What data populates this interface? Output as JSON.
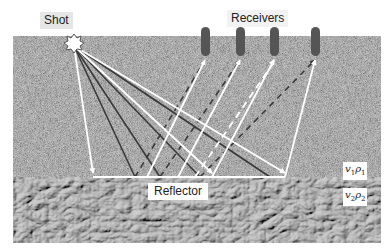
{
  "labels": {
    "shot": "Shot",
    "receivers": "Receivers",
    "reflector": "Reflector"
  },
  "layers": [
    {
      "name": "upper",
      "velocity": "v",
      "velocity_sub": "1",
      "density": "ρ",
      "density_sub": "1"
    },
    {
      "name": "lower",
      "velocity": "v",
      "velocity_sub": "2",
      "density": "ρ",
      "density_sub": "2"
    }
  ],
  "receiver_count": 4,
  "colors": {
    "upper_layer": "#8a8a8a",
    "lower_layer": "#9a9a9a",
    "receiver": "#555555",
    "ray_primary": "#ffffff",
    "ray_secondary": "#3a3a3a",
    "label_bg": "#e6e6e6"
  }
}
